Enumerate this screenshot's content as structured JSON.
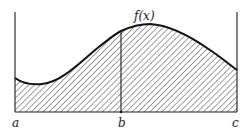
{
  "figure": {
    "function_label": "f(x)",
    "points": {
      "a": "a",
      "b": "b",
      "c": "c"
    },
    "colors": {
      "ink": "#1a1a1a",
      "background": "#ffffff"
    }
  }
}
